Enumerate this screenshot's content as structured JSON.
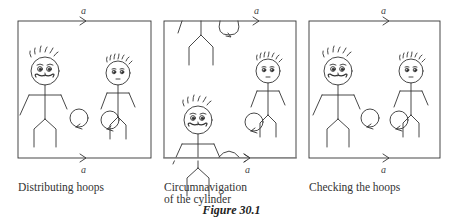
{
  "figure": {
    "title": "Figure 30.1",
    "edge_label": "a",
    "panels": [
      {
        "id": "distributing",
        "caption": "Distributing hoops"
      },
      {
        "id": "circumnavigation",
        "caption_line1": "Circumnavigation",
        "caption_line2": "of the cylinder"
      },
      {
        "id": "checking",
        "caption": "Checking the hoops"
      }
    ]
  }
}
